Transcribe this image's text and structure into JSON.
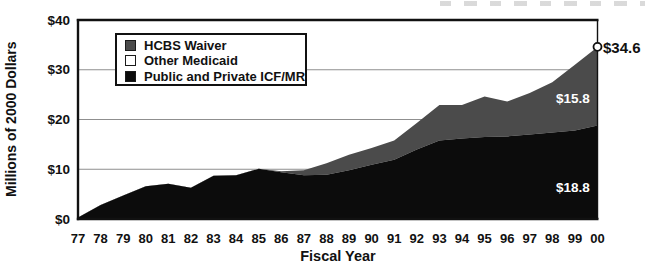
{
  "chart_data": {
    "type": "area",
    "stacked": true,
    "title": "",
    "xlabel": "Fiscal Year",
    "ylabel": "Millions of 2000 Dollars",
    "x": [
      "77",
      "78",
      "79",
      "80",
      "81",
      "82",
      "83",
      "84",
      "85",
      "86",
      "87",
      "88",
      "89",
      "90",
      "91",
      "92",
      "93",
      "94",
      "95",
      "96",
      "97",
      "98",
      "99",
      "00"
    ],
    "ylim": [
      0,
      40
    ],
    "grid_values": [
      10,
      20,
      30
    ],
    "grid_on": true,
    "y_ticks": [
      {
        "label": "$40",
        "value": 40
      },
      {
        "label": "$30",
        "value": 30
      },
      {
        "label": "$20",
        "value": 20
      },
      {
        "label": "$10",
        "value": 10
      },
      {
        "label": "$0",
        "value": 0
      }
    ],
    "series": [
      {
        "name": "Public and Private ICF/MR",
        "color": "#0c0c0c",
        "values": [
          0.3,
          2.8,
          4.7,
          6.6,
          7.1,
          6.3,
          8.7,
          8.8,
          10.1,
          9.4,
          8.8,
          8.9,
          9.8,
          10.9,
          11.9,
          14.0,
          15.8,
          16.2,
          16.5,
          16.6,
          17.0,
          17.4,
          17.8,
          18.8
        ]
      },
      {
        "name": "Other Medicaid",
        "color": "#ffffff",
        "values": [
          0,
          0,
          0,
          0,
          0,
          0,
          0,
          0,
          0,
          0,
          0,
          0,
          0,
          0,
          0,
          0,
          0,
          0,
          0,
          0,
          0,
          0,
          0,
          0
        ]
      },
      {
        "name": "HCBS Waiver",
        "color": "#4b4b4b",
        "values": [
          0,
          0,
          0,
          0,
          0,
          0,
          0,
          0,
          0,
          0.2,
          1.0,
          2.3,
          3.1,
          3.4,
          3.9,
          5.3,
          7.1,
          6.7,
          8.1,
          7.0,
          8.3,
          10.1,
          13.2,
          15.8
        ]
      }
    ],
    "legend_position": "top-left",
    "annotations": [
      {
        "text": "$34.6",
        "target": "total at FY00",
        "color": "#111111"
      },
      {
        "text": "$15.8",
        "target": "HCBS Waiver at FY00",
        "color": "#ffffff"
      },
      {
        "text": "$18.8",
        "target": "Public and Private ICF/MR at FY00",
        "color": "#ffffff"
      }
    ],
    "end_marker": {
      "shape": "circle",
      "fill": "#ffffff",
      "stroke": "#111111",
      "value": 34.6
    }
  },
  "colors": {
    "hcbs_area": "#4b4b4b",
    "icfmr_area": "#0c0c0c",
    "other_area": "#ffffff",
    "gridline": "#8f8f8f",
    "frame": "#111111",
    "background": "#ffffff"
  }
}
